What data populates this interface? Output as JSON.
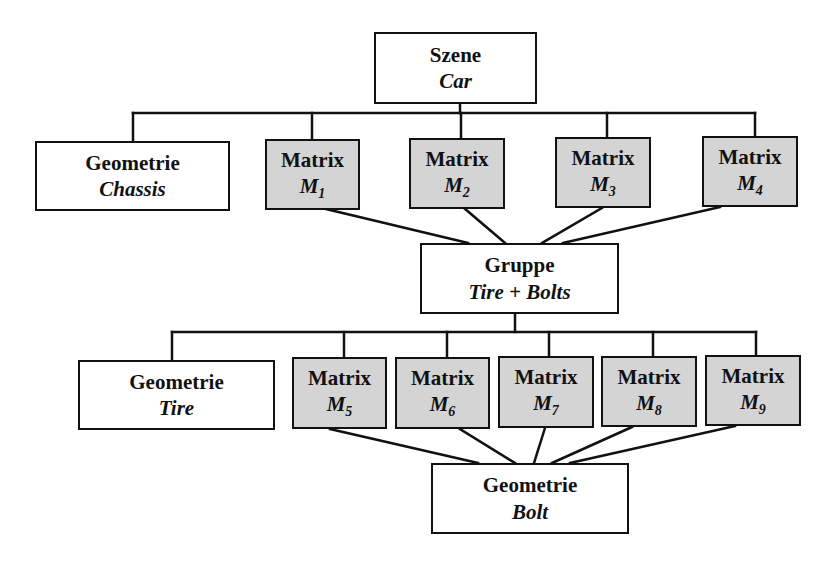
{
  "diagram": {
    "type": "scene-graph",
    "colors": {
      "matrix_fill": "#d4d4d4",
      "node_fill": "#ffffff",
      "line": "#111111"
    },
    "root": {
      "title": "Szene",
      "name": "Car"
    },
    "level1": {
      "geometry": {
        "title": "Geometrie",
        "name": "Chassis"
      },
      "matrices": [
        {
          "title": "Matrix",
          "name": "M",
          "sub": "1"
        },
        {
          "title": "Matrix",
          "name": "M",
          "sub": "2"
        },
        {
          "title": "Matrix",
          "name": "M",
          "sub": "3"
        },
        {
          "title": "Matrix",
          "name": "M",
          "sub": "4"
        }
      ]
    },
    "group": {
      "title": "Gruppe",
      "name": "Tire + Bolts"
    },
    "level2": {
      "geometry": {
        "title": "Geometrie",
        "name": "Tire"
      },
      "matrices": [
        {
          "title": "Matrix",
          "name": "M",
          "sub": "5"
        },
        {
          "title": "Matrix",
          "name": "M",
          "sub": "6"
        },
        {
          "title": "Matrix",
          "name": "M",
          "sub": "7"
        },
        {
          "title": "Matrix",
          "name": "M",
          "sub": "8"
        },
        {
          "title": "Matrix",
          "name": "M",
          "sub": "9"
        }
      ]
    },
    "leaf": {
      "title": "Geometrie",
      "name": "Bolt"
    },
    "edges": [
      [
        "Szene Car",
        "Geometrie Chassis"
      ],
      [
        "Szene Car",
        "Matrix M1"
      ],
      [
        "Szene Car",
        "Matrix M2"
      ],
      [
        "Szene Car",
        "Matrix M3"
      ],
      [
        "Szene Car",
        "Matrix M4"
      ],
      [
        "Matrix M1",
        "Gruppe Tire + Bolts"
      ],
      [
        "Matrix M2",
        "Gruppe Tire + Bolts"
      ],
      [
        "Matrix M3",
        "Gruppe Tire + Bolts"
      ],
      [
        "Matrix M4",
        "Gruppe Tire + Bolts"
      ],
      [
        "Gruppe Tire + Bolts",
        "Geometrie Tire"
      ],
      [
        "Gruppe Tire + Bolts",
        "Matrix M5"
      ],
      [
        "Gruppe Tire + Bolts",
        "Matrix M6"
      ],
      [
        "Gruppe Tire + Bolts",
        "Matrix M7"
      ],
      [
        "Gruppe Tire + Bolts",
        "Matrix M8"
      ],
      [
        "Gruppe Tire + Bolts",
        "Matrix M9"
      ],
      [
        "Matrix M5",
        "Geometrie Bolt"
      ],
      [
        "Matrix M6",
        "Geometrie Bolt"
      ],
      [
        "Matrix M7",
        "Geometrie Bolt"
      ],
      [
        "Matrix M8",
        "Geometrie Bolt"
      ],
      [
        "Matrix M9",
        "Geometrie Bolt"
      ]
    ]
  }
}
